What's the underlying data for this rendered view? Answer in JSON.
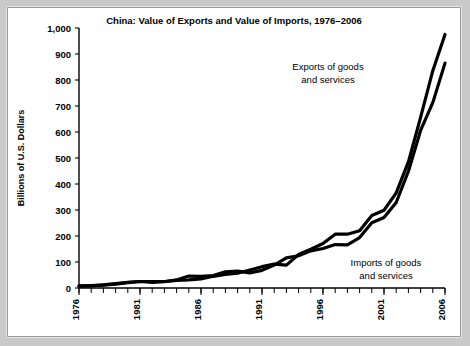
{
  "figure": {
    "background_color": "#ffffff",
    "page_background_color": "#c9c9c9",
    "border_color": "#9a9a9a"
  },
  "chart_data": {
    "type": "line",
    "title": "China: Value of Exports and Value of Imports, 1976–2006",
    "xlabel": "",
    "ylabel": "Billions of U.S. Dollars",
    "xlim": [
      1976,
      2006
    ],
    "ylim": [
      0,
      1000
    ],
    "grid": false,
    "legend_position": "inline-annotation",
    "ytick_labels": [
      "0",
      "100",
      "200",
      "300",
      "400",
      "500",
      "600",
      "700",
      "800",
      "900",
      "1,000"
    ],
    "ytick_values": [
      0,
      100,
      200,
      300,
      400,
      500,
      600,
      700,
      800,
      900,
      1000
    ],
    "xtick_labels": [
      "1976",
      "1981",
      "1986",
      "1991",
      "1996",
      "2001",
      "2006"
    ],
    "xtick_values": [
      1976,
      1981,
      1986,
      1991,
      1996,
      2001,
      2006
    ],
    "xtick_minor_step": 1,
    "x": [
      1976,
      1977,
      1978,
      1979,
      1980,
      1981,
      1982,
      1983,
      1984,
      1985,
      1986,
      1987,
      1988,
      1989,
      1990,
      1991,
      1992,
      1993,
      1994,
      1995,
      1996,
      1997,
      1998,
      1999,
      2000,
      2001,
      2002,
      2003,
      2004,
      2005,
      2006
    ],
    "series": [
      {
        "name": "Exports of goods and services",
        "color": "#000000",
        "annotation": "Exports of goods\nand services",
        "values": [
          8,
          9,
          11,
          15,
          21,
          25,
          25,
          25,
          29,
          31,
          35,
          45,
          52,
          57,
          69,
          82,
          92,
          88,
          129,
          149,
          171,
          207,
          207,
          220,
          279,
          299,
          366,
          485,
          656,
          836,
          975
        ]
      },
      {
        "name": "Imports of goods and services",
        "color": "#000000",
        "annotation": "Imports of goods\nand services",
        "values": [
          7,
          8,
          12,
          17,
          22,
          25,
          22,
          24,
          31,
          46,
          45,
          48,
          62,
          65,
          58,
          68,
          88,
          116,
          124,
          143,
          152,
          167,
          166,
          194,
          251,
          271,
          329,
          449,
          606,
          713,
          865
        ]
      }
    ],
    "annotations": [
      {
        "text_line1": "Exports of goods",
        "text_line2": "and services"
      },
      {
        "text_line1": "Imports of goods",
        "text_line2": "and services"
      }
    ]
  }
}
